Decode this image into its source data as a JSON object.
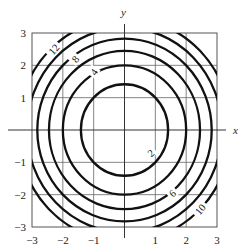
{
  "chart_data": {
    "type": "contour",
    "function": "f(x, y) = x^2 + y^2",
    "title": "",
    "xlabel": "x",
    "ylabel": "y",
    "xlim": [
      -3,
      3
    ],
    "ylim": [
      -3,
      3
    ],
    "grid": true,
    "x_ticks": [
      "-3",
      "-2",
      "-1",
      "1",
      "2",
      "3"
    ],
    "y_ticks": [
      "3",
      "2",
      "1",
      "-1",
      "-2",
      "-3"
    ],
    "x_tick_values": [
      -3,
      -2,
      -1,
      1,
      2,
      3
    ],
    "y_tick_values": [
      3,
      2,
      1,
      -1,
      -2,
      -3
    ],
    "levels": [
      2,
      4,
      6,
      8,
      10,
      12
    ],
    "contour_labels": [
      {
        "text": "12",
        "x": -2.3,
        "y": 2.5,
        "angle": -50
      },
      {
        "text": "8",
        "x": -1.6,
        "y": 2.2,
        "angle": -50
      },
      {
        "text": "4",
        "x": -1.0,
        "y": 1.8,
        "angle": -55
      },
      {
        "text": "2",
        "x": 0.85,
        "y": -0.7,
        "angle": -40
      },
      {
        "text": "6",
        "x": 1.55,
        "y": -1.95,
        "angle": -40
      },
      {
        "text": "10",
        "x": 2.45,
        "y": -2.45,
        "angle": -50
      }
    ],
    "line_color": "#111111"
  }
}
